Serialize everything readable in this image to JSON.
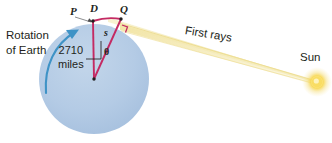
{
  "figure": {
    "type": "geometry-diagram",
    "background_color": "#ffffff"
  },
  "earth": {
    "label_name": "earth-circle",
    "fill_color": "#b7cde6",
    "radius_label": "2710\nmiles",
    "radius_value": "2710",
    "radius_unit": "miles",
    "radius_line_1": "2710",
    "radius_line_2": "miles"
  },
  "rotation": {
    "label": "Rotation\nof Earth",
    "line_1": "Rotation",
    "line_2": "of Earth",
    "arrow_color": "#3a8fc4"
  },
  "points": {
    "P": "P",
    "D": "D",
    "Q": "Q"
  },
  "triangle": {
    "color": "#c42a63",
    "arc_label": "s",
    "angle_label": "θ",
    "right_angle_marker": "right-angle"
  },
  "rays": {
    "label": "First rays",
    "color": "#f2e39a"
  },
  "sun": {
    "label": "Sun",
    "core_color": "#ffffff",
    "mid_color": "#f7d84a",
    "glow_color": "#f6e9a8"
  }
}
